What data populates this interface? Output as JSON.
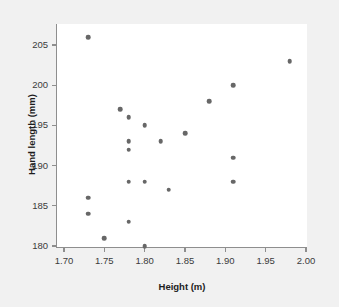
{
  "chart_data": {
    "type": "scatter",
    "title": "",
    "xlabel": "Height (m)",
    "ylabel": "Hand length (mm)",
    "xlim": [
      1.7,
      2.0
    ],
    "ylim": [
      178.5,
      207.5
    ],
    "xticks": [
      1.7,
      1.75,
      1.8,
      1.85,
      1.9,
      1.95,
      2.0
    ],
    "xtick_labels": [
      "1.70",
      "1.75",
      "1.80",
      "1.85",
      "1.90",
      "1.95",
      "2.00"
    ],
    "yticks": [
      180,
      185,
      190,
      195,
      200,
      205
    ],
    "ytick_labels": [
      "180",
      "185",
      "190",
      "195",
      "200",
      "205"
    ],
    "grid": false,
    "legend": null,
    "marker_color": "#676767",
    "marker_shape": "circle",
    "plot_background": "#ffffff",
    "figure_background": "#f1f1f1",
    "axis_color": "#8e8e8e",
    "points": [
      {
        "x": 1.73,
        "y": 206
      },
      {
        "x": 1.98,
        "y": 203
      },
      {
        "x": 1.91,
        "y": 200
      },
      {
        "x": 1.88,
        "y": 198
      },
      {
        "x": 1.77,
        "y": 197
      },
      {
        "x": 1.78,
        "y": 196
      },
      {
        "x": 1.8,
        "y": 195
      },
      {
        "x": 1.85,
        "y": 194
      },
      {
        "x": 1.78,
        "y": 193
      },
      {
        "x": 1.82,
        "y": 193
      },
      {
        "x": 1.78,
        "y": 192
      },
      {
        "x": 1.91,
        "y": 191
      },
      {
        "x": 1.78,
        "y": 188
      },
      {
        "x": 1.8,
        "y": 188
      },
      {
        "x": 1.91,
        "y": 188
      },
      {
        "x": 1.83,
        "y": 187
      },
      {
        "x": 1.73,
        "y": 186
      },
      {
        "x": 1.73,
        "y": 184
      },
      {
        "x": 1.78,
        "y": 183
      },
      {
        "x": 1.75,
        "y": 181
      },
      {
        "x": 1.8,
        "y": 180
      }
    ]
  }
}
